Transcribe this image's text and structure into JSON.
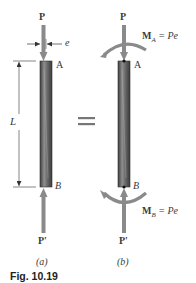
{
  "figure": {
    "caption": "Fig. 10.19",
    "colors": {
      "arrow": "#8a8a8a",
      "column_dark": "#4a4a4a",
      "column_light": "#a8a8a8",
      "text": "#3a3a3a",
      "dimension_line": "#333333"
    }
  },
  "panel_a": {
    "sublabel": "(a)",
    "load_top": "P",
    "load_bottom": "P'",
    "eccentricity": "e",
    "length": "L",
    "point_top": "A",
    "point_bottom": "B"
  },
  "equals_sign": "=",
  "panel_b": {
    "sublabel": "(b)",
    "load_top": "P",
    "load_bottom": "P'",
    "point_top": "A",
    "point_bottom": "B",
    "moment_top": {
      "symbol": "M",
      "subscript": "A",
      "equation": "= Pe"
    },
    "moment_bottom": {
      "symbol": "M",
      "subscript": "B",
      "equation": "= Pe"
    }
  }
}
